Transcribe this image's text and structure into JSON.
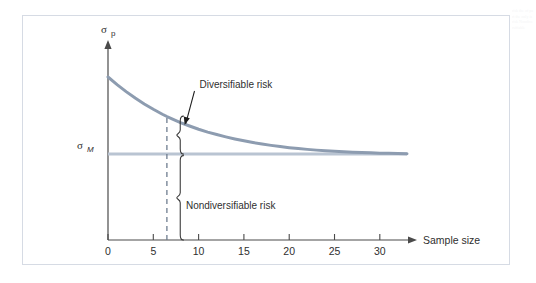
{
  "figure": {
    "frame_color": "#d6dbe4",
    "background": "#ffffff"
  },
  "chart_data": {
    "type": "line",
    "title": "",
    "subtitle": "",
    "xlabel": "Sample size",
    "ylabel": "",
    "y_axis_symbol": "σ",
    "y_axis_subscript": "p",
    "grid": false,
    "legend": "none",
    "xlim": [
      0,
      33
    ],
    "ylim": [
      0,
      1
    ],
    "x_ticks": [
      0,
      5,
      10,
      15,
      20,
      25,
      30
    ],
    "x_tick_labels": [
      "0",
      "5",
      "10",
      "15",
      "20",
      "25",
      "30"
    ],
    "y_ticks": [],
    "y_tick_labels": [],
    "series": [
      {
        "name": "Portfolio standard deviation",
        "color": "#8d9cb0",
        "width": 3,
        "x": [
          0,
          1,
          2,
          3,
          4,
          5,
          6,
          6.5,
          7,
          8,
          9,
          10,
          11,
          12,
          13,
          14,
          15,
          16,
          17,
          18,
          19,
          20,
          21,
          22,
          23,
          24,
          25,
          26,
          27,
          28,
          29,
          30,
          31,
          32,
          33
        ],
        "y": [
          0.858,
          0.818,
          0.781,
          0.747,
          0.716,
          0.688,
          0.662,
          0.65,
          0.639,
          0.618,
          0.6,
          0.583,
          0.568,
          0.555,
          0.543,
          0.532,
          0.522,
          0.513,
          0.505,
          0.498,
          0.492,
          0.486,
          0.481,
          0.477,
          0.473,
          0.47,
          0.467,
          0.464,
          0.462,
          0.46,
          0.459,
          0.457,
          0.456,
          0.455,
          0.454
        ]
      }
    ],
    "reference_lines": [
      {
        "name": "market-risk-line",
        "orientation": "horizontal",
        "label_symbol": "σ",
        "label_subscript": "M",
        "y_value": 0.452,
        "color": "#b9c4d2",
        "width": 3,
        "x_from": 0,
        "x_to": 33
      },
      {
        "name": "sample-size-marker",
        "orientation": "vertical",
        "x_value": 6.5,
        "style": "dashed",
        "color": "#6f7d90",
        "width": 1.2
      }
    ],
    "annotations": [
      {
        "name": "diversifiable-risk",
        "text": "Diversifiable risk",
        "text_x": 10.1,
        "text_y": 0.8,
        "arrow_to_x": 7.9,
        "arrow_to_y": 0.56,
        "brace_from_y": 0.652,
        "brace_to_y": 0.452,
        "brace_x": 7.2
      },
      {
        "name": "nondiversifiable-risk",
        "text": "Nondiversifiable risk",
        "text_x": 8.6,
        "text_y": 0.185,
        "brace_from_y": 0.452,
        "brace_to_y": 0.0,
        "brace_x": 7.2
      }
    ],
    "axis_arrows": {
      "x_axis": true,
      "y_axis": true
    },
    "axis_color": "#4a4a4a"
  },
  "margin_artifact": {
    "text": "risk the of part the only is risk Nondiversifiable"
  }
}
